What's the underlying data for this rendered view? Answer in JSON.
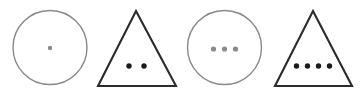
{
  "figure": {
    "canvas": {
      "width": 364,
      "height": 92,
      "background_color": "#ffffff"
    },
    "palette": {
      "circle_stroke": "#8a8a8a",
      "triangle_stroke": "#2b2b2b",
      "circle_dot_fill": "#8a8a8a",
      "triangle_dot_fill": "#1a1a1a"
    },
    "shapes": [
      {
        "index": 1,
        "kind": "circle",
        "label": "circle-one-dot",
        "dot_count": 1,
        "center_x": 50,
        "center_y": 47.5,
        "radius": 37,
        "stroke_color": "#8a8a8a",
        "stroke_width": 1.4,
        "dot_fill": "#8a8a8a",
        "dot_radius": 2.2,
        "dot_row_y": 48,
        "dot_spacing": 11,
        "dots": [
          {
            "cx": 50,
            "cy": 48,
            "r": 2.2
          }
        ]
      },
      {
        "index": 2,
        "kind": "triangle",
        "label": "triangle-two-dots",
        "dot_count": 2,
        "apex_x": 136,
        "apex_y": 11,
        "base_left_x": 98,
        "base_right_x": 176,
        "base_y": 86,
        "stroke_color": "#2b2b2b",
        "stroke_width": 2.1,
        "dot_fill": "#1a1a1a",
        "dot_radius": 2.7,
        "dot_row_y": 66,
        "dot_spacing": 15,
        "dots": [
          {
            "cx": 129,
            "cy": 66,
            "r": 2.7
          },
          {
            "cx": 144,
            "cy": 66,
            "r": 2.7
          }
        ]
      },
      {
        "index": 3,
        "kind": "circle",
        "label": "circle-three-dots",
        "dot_count": 3,
        "center_x": 224.5,
        "center_y": 47.5,
        "radius": 37,
        "stroke_color": "#8a8a8a",
        "stroke_width": 1.4,
        "dot_fill": "#8a8a8a",
        "dot_radius": 2.6,
        "dot_row_y": 49,
        "dot_spacing": 11,
        "dots": [
          {
            "cx": 213.5,
            "cy": 49,
            "r": 2.6
          },
          {
            "cx": 224.5,
            "cy": 49,
            "r": 2.6
          },
          {
            "cx": 235.5,
            "cy": 49,
            "r": 2.6
          }
        ]
      },
      {
        "index": 4,
        "kind": "triangle",
        "label": "triangle-four-dots",
        "dot_count": 4,
        "apex_x": 313,
        "apex_y": 11,
        "base_left_x": 275,
        "base_right_x": 352,
        "base_y": 86,
        "stroke_color": "#2b2b2b",
        "stroke_width": 2.1,
        "dot_fill": "#1a1a1a",
        "dot_radius": 2.7,
        "dot_row_y": 66,
        "dot_spacing": 11,
        "dots": [
          {
            "cx": 296.5,
            "cy": 66,
            "r": 2.7
          },
          {
            "cx": 307.5,
            "cy": 66,
            "r": 2.7
          },
          {
            "cx": 318.5,
            "cy": 66,
            "r": 2.7
          },
          {
            "cx": 329.5,
            "cy": 66,
            "r": 2.7
          }
        ]
      }
    ]
  }
}
